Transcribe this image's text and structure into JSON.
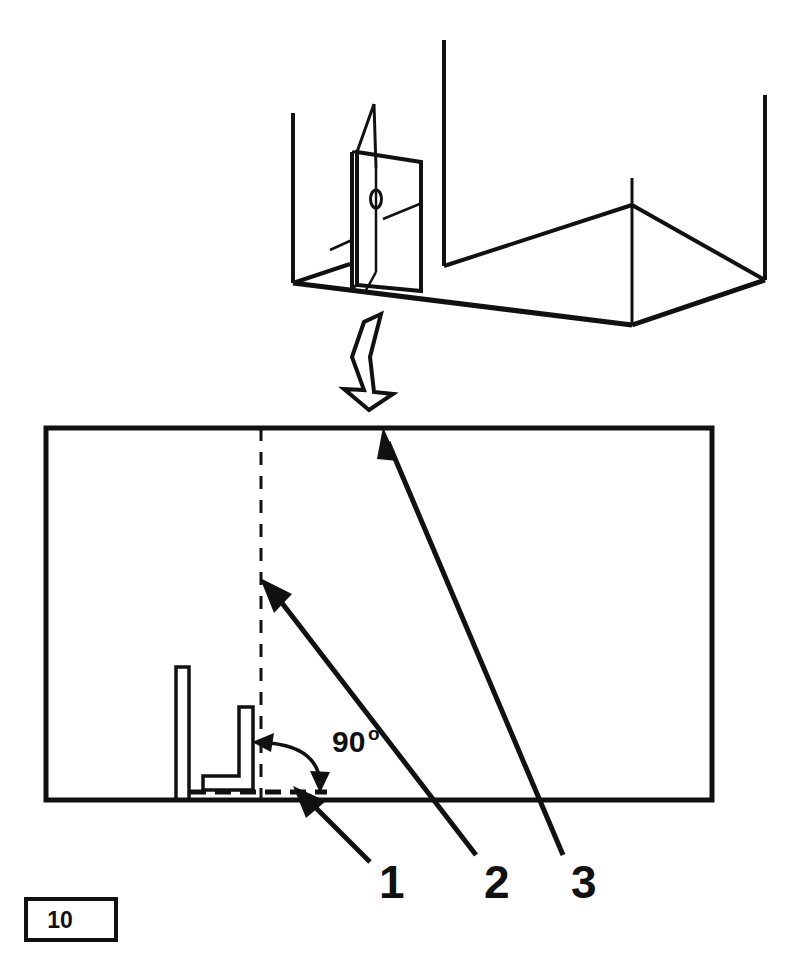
{
  "figure": {
    "page_number": "10",
    "angle_label": {
      "value": "90",
      "unit": "o"
    },
    "callouts": [
      {
        "id": "1",
        "label": "1"
      },
      {
        "id": "2",
        "label": "2"
      },
      {
        "id": "3",
        "label": "3"
      }
    ],
    "colors": {
      "ink": "#111111",
      "paper": "#ffffff"
    },
    "views": {
      "isometric": {
        "name": "isometric-assembly-view",
        "description": "open-box with upright partition panel"
      },
      "elevation": {
        "name": "elevation-detail-view",
        "description": "side elevation of post and right-angle bracket"
      }
    }
  }
}
